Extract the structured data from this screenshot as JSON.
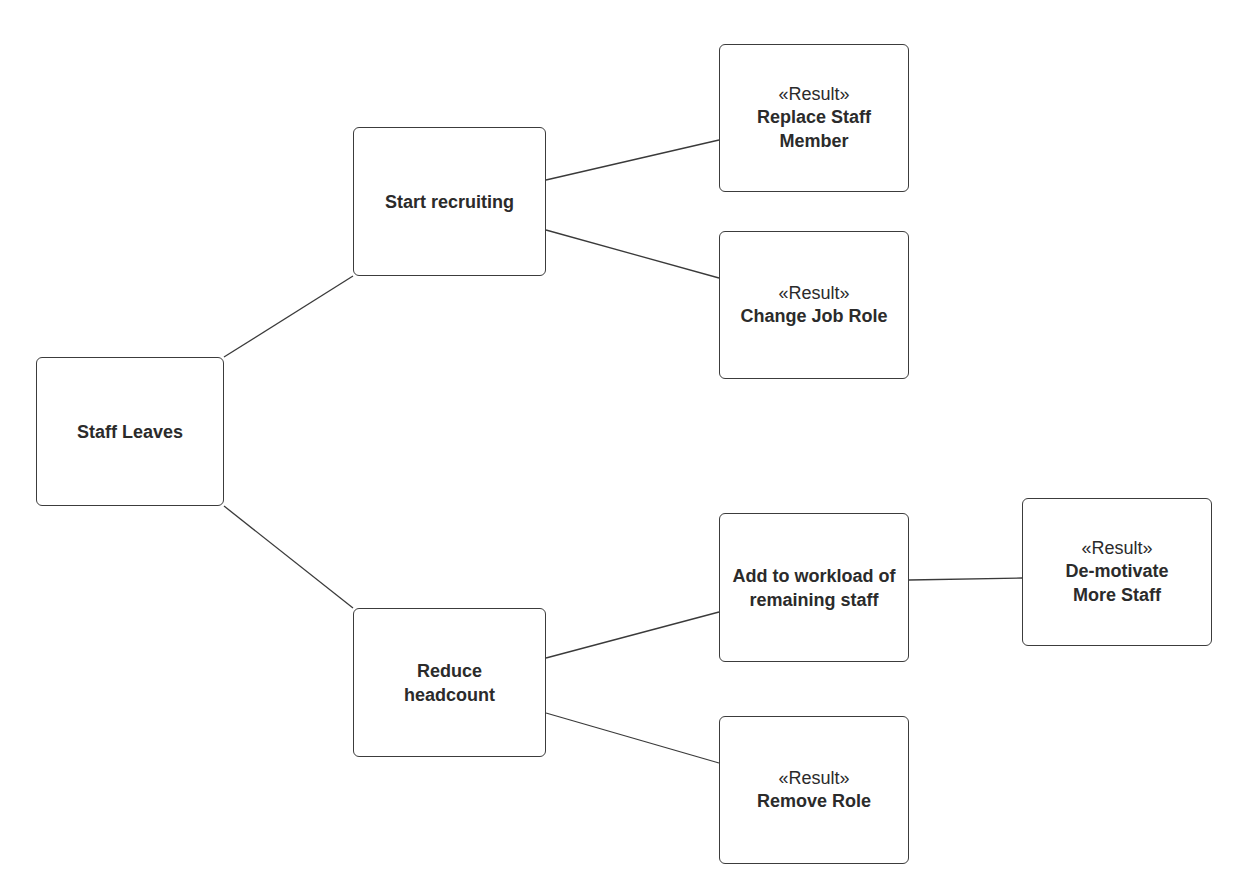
{
  "diagram": {
    "type": "decision-tree",
    "nodes": [
      {
        "id": "staff_leaves",
        "stereotype": "",
        "label": "Staff Leaves",
        "x": 36,
        "y": 357,
        "w": 188,
        "h": 149
      },
      {
        "id": "start_recruiting",
        "stereotype": "",
        "label": "Start recruiting",
        "x": 353,
        "y": 127,
        "w": 193,
        "h": 149
      },
      {
        "id": "replace_staff",
        "stereotype": "«Result»",
        "label": "Replace Staff Member",
        "x": 719,
        "y": 44,
        "w": 190,
        "h": 148
      },
      {
        "id": "change_job_role",
        "stereotype": "«Result»",
        "label": "Change Job Role",
        "x": 719,
        "y": 231,
        "w": 190,
        "h": 148
      },
      {
        "id": "reduce_headcount",
        "stereotype": "",
        "label": "Reduce headcount",
        "x": 353,
        "y": 608,
        "w": 193,
        "h": 149
      },
      {
        "id": "add_workload",
        "stereotype": "",
        "label": "Add to workload of remaining staff",
        "x": 719,
        "y": 513,
        "w": 190,
        "h": 149
      },
      {
        "id": "demotivate",
        "stereotype": "«Result»",
        "label": "De-motivate More Staff",
        "x": 1022,
        "y": 498,
        "w": 190,
        "h": 148
      },
      {
        "id": "remove_role",
        "stereotype": "«Result»",
        "label": "Remove Role",
        "x": 719,
        "y": 716,
        "w": 190,
        "h": 148
      }
    ],
    "edges": [
      {
        "from": "staff_leaves",
        "to": "start_recruiting",
        "x1": 224,
        "y1": 357,
        "x2": 353,
        "y2": 276
      },
      {
        "from": "staff_leaves",
        "to": "reduce_headcount",
        "x1": 224,
        "y1": 506,
        "x2": 353,
        "y2": 608
      },
      {
        "from": "start_recruiting",
        "to": "replace_staff",
        "x1": 546,
        "y1": 180,
        "x2": 719,
        "y2": 140
      },
      {
        "from": "start_recruiting",
        "to": "change_job_role",
        "x1": 546,
        "y1": 230,
        "x2": 719,
        "y2": 278
      },
      {
        "from": "reduce_headcount",
        "to": "add_workload",
        "x1": 546,
        "y1": 658,
        "x2": 719,
        "y2": 612
      },
      {
        "from": "reduce_headcount",
        "to": "remove_role",
        "x1": 546,
        "y1": 713,
        "x2": 719,
        "y2": 763
      },
      {
        "from": "add_workload",
        "to": "demotivate",
        "x1": 909,
        "y1": 580,
        "x2": 1022,
        "y2": 578
      }
    ]
  }
}
